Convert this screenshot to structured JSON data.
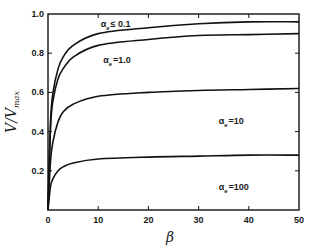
{
  "chart_data": {
    "type": "line",
    "title": "",
    "xlabel": "β",
    "ylabel": "V/V_max",
    "xlim": [
      0,
      50
    ],
    "ylim": [
      0,
      1.0
    ],
    "x_ticks": [
      0,
      10,
      20,
      30,
      40,
      50
    ],
    "y_ticks": [
      0.2,
      0.4,
      0.6,
      0.8,
      1.0
    ],
    "x_tick_labels": [
      "0",
      "10",
      "20",
      "30",
      "40",
      "50"
    ],
    "y_tick_labels": [
      "0.2",
      "0.4",
      "0.6",
      "0.8",
      "1.0"
    ],
    "grid": false,
    "legend": "inline labels",
    "series": [
      {
        "name": "αe ≤ 0.1",
        "label_main": "α",
        "label_sub": "e",
        "label_rest": "≤ 0.1",
        "x": [
          0,
          0.5,
          1,
          2,
          3,
          5,
          10,
          20,
          30,
          40,
          50
        ],
        "values": [
          0,
          0.45,
          0.6,
          0.72,
          0.78,
          0.84,
          0.9,
          0.93,
          0.95,
          0.96,
          0.96
        ]
      },
      {
        "name": "αe = 1.0",
        "label_main": "α",
        "label_sub": "e",
        "label_rest": "=1.0",
        "x": [
          0,
          0.5,
          1,
          2,
          3,
          5,
          10,
          20,
          30,
          40,
          50
        ],
        "values": [
          0,
          0.42,
          0.56,
          0.67,
          0.72,
          0.78,
          0.84,
          0.87,
          0.89,
          0.895,
          0.9
        ]
      },
      {
        "name": "αe = 10",
        "label_main": "α",
        "label_sub": "e",
        "label_rest": "=10",
        "x": [
          0,
          0.5,
          1,
          2,
          3,
          5,
          10,
          20,
          30,
          40,
          50
        ],
        "values": [
          0,
          0.25,
          0.35,
          0.45,
          0.5,
          0.54,
          0.58,
          0.6,
          0.61,
          0.615,
          0.62
        ]
      },
      {
        "name": "αe = 100",
        "label_main": "α",
        "label_sub": "e",
        "label_rest": "=100",
        "x": [
          0,
          0.5,
          1,
          2,
          3,
          5,
          10,
          20,
          30,
          40,
          50
        ],
        "values": [
          0,
          0.12,
          0.16,
          0.2,
          0.22,
          0.24,
          0.26,
          0.27,
          0.275,
          0.28,
          0.28
        ]
      }
    ],
    "label_positions": [
      [
        10.5,
        0.935
      ],
      [
        11,
        0.75
      ],
      [
        34,
        0.44
      ],
      [
        34,
        0.1
      ]
    ]
  },
  "colors": {
    "line": "#111111",
    "background": "#ffffff"
  }
}
